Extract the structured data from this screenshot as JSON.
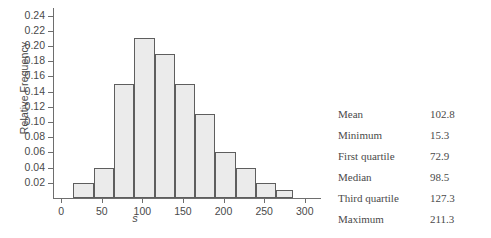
{
  "chart_data": {
    "type": "bar",
    "title": "",
    "subtitle": "",
    "xlabel": "s",
    "ylabel": "Relative Frequency",
    "xlim": [
      -10,
      320
    ],
    "ylim": [
      0,
      0.25
    ],
    "grid": false,
    "legend": null,
    "bin_width": 25,
    "x_ticks": [
      0,
      50,
      100,
      150,
      200,
      250,
      300
    ],
    "x_tick_labels": [
      "0",
      "50",
      "100",
      "150",
      "200",
      "250",
      "300"
    ],
    "y_ticks": [
      0.02,
      0.04,
      0.06,
      0.08,
      0.1,
      0.12,
      0.14,
      0.16,
      0.18,
      0.2,
      0.22,
      0.24
    ],
    "y_tick_labels": [
      "0.24",
      "0.22",
      "0.20",
      "0.18",
      "0.16",
      "0.14",
      "0.12",
      "0.10",
      "0.08",
      "0.06",
      "0.04",
      "0.02"
    ],
    "bins": [
      {
        "start": 15,
        "end": 40,
        "value": 0.02
      },
      {
        "start": 40,
        "end": 65,
        "value": 0.04
      },
      {
        "start": 65,
        "end": 90,
        "value": 0.15
      },
      {
        "start": 90,
        "end": 115,
        "value": 0.21
      },
      {
        "start": 115,
        "end": 140,
        "value": 0.19
      },
      {
        "start": 140,
        "end": 165,
        "value": 0.15
      },
      {
        "start": 165,
        "end": 190,
        "value": 0.11
      },
      {
        "start": 190,
        "end": 215,
        "value": 0.06
      },
      {
        "start": 215,
        "end": 240,
        "value": 0.04
      },
      {
        "start": 240,
        "end": 265,
        "value": 0.02
      },
      {
        "start": 265,
        "end": 285,
        "value": 0.01
      }
    ],
    "categories": [
      "15-40",
      "40-65",
      "65-90",
      "90-115",
      "115-140",
      "140-165",
      "165-190",
      "190-215",
      "215-240",
      "240-265",
      "265-285"
    ],
    "values": [
      0.02,
      0.04,
      0.15,
      0.21,
      0.19,
      0.15,
      0.11,
      0.06,
      0.04,
      0.02,
      0.01
    ],
    "bar_fill_color": "#ebebeb",
    "bar_edge_color": "#5e5e5e",
    "axis_color": "#6e6e6e"
  },
  "stats": {
    "rows": [
      {
        "label": "Mean",
        "value": "102.8"
      },
      {
        "label": "Minimum",
        "value": "15.3"
      },
      {
        "label": "First quartile",
        "value": "72.9"
      },
      {
        "label": "Median",
        "value": "98.5"
      },
      {
        "label": "Third quartile",
        "value": "127.3"
      },
      {
        "label": "Maximum",
        "value": "211.3"
      }
    ]
  }
}
